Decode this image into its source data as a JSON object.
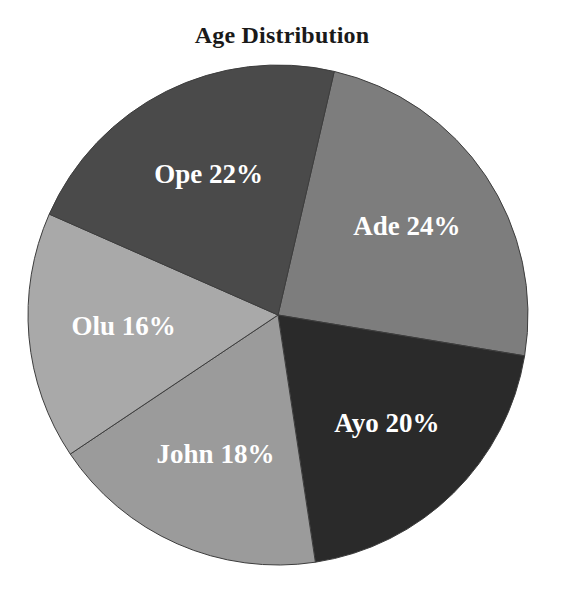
{
  "chart_data": {
    "type": "pie",
    "title": "Age Distribution",
    "xlabel": "",
    "ylabel": "",
    "categories": [
      "Ade",
      "Ayo",
      "John",
      "Olu",
      "Ope"
    ],
    "values": [
      24,
      20,
      18,
      16,
      22
    ],
    "value_unit": "%",
    "total": 100,
    "labels": [
      "Ade 24%",
      "Ayo 20%",
      "John 18%",
      "Olu 16%",
      "Ope 22%"
    ],
    "colors": [
      "#7d7d7d",
      "#2a2a2a",
      "#9b9b9b",
      "#a9a9a9",
      "#4a4a4a"
    ],
    "label_color": "#ffffff",
    "start_angle_deg": 13,
    "direction": "clockwise",
    "legend": "none",
    "grid": false,
    "slices": [
      {
        "name": "Ade",
        "value": 24,
        "label": "Ade 24%",
        "color": "#7d7d7d"
      },
      {
        "name": "Ayo",
        "value": 20,
        "label": "Ayo 20%",
        "color": "#2a2a2a"
      },
      {
        "name": "John",
        "value": 18,
        "label": "John 18%",
        "color": "#9b9b9b"
      },
      {
        "name": "Olu",
        "value": 16,
        "label": "Olu 16%",
        "color": "#a9a9a9"
      },
      {
        "name": "Ope",
        "value": 22,
        "label": "Ope 22%",
        "color": "#4a4a4a"
      }
    ]
  },
  "geometry": {
    "center_x": 278,
    "center_y": 315,
    "radius": 250
  }
}
